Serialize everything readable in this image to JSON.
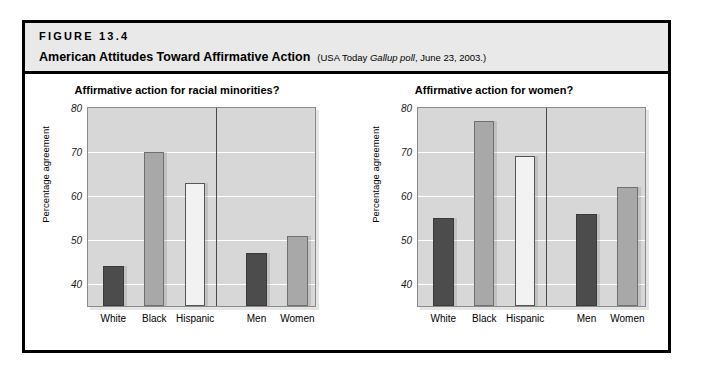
{
  "figure": {
    "number": "FIGURE 13.4",
    "title": "American Attitudes Toward Affirmative Action",
    "source_prefix": "(USA Today ",
    "source_italic": "Gallup poll",
    "source_suffix": ", June 23, 2003.)"
  },
  "chart_data": [
    {
      "type": "bar",
      "title": "Affirmative action for racial minorities?",
      "xlabel": "",
      "ylabel": "Percentage agreement",
      "ylim": [
        35,
        80
      ],
      "yticks": [
        40,
        50,
        60,
        70,
        80
      ],
      "grid": true,
      "legend": "none",
      "categories": [
        "White",
        "Black",
        "Hispanic",
        "Men",
        "Women"
      ],
      "values": [
        44,
        70,
        63,
        47,
        51
      ],
      "group_break_after": "Hispanic",
      "bar_styles": [
        "dark",
        "mid",
        "light",
        "dark",
        "mid"
      ]
    },
    {
      "type": "bar",
      "title": "Affirmative action for women?",
      "xlabel": "",
      "ylabel": "Percentage agreement",
      "ylim": [
        35,
        80
      ],
      "yticks": [
        40,
        50,
        60,
        70,
        80
      ],
      "grid": true,
      "legend": "none",
      "categories": [
        "White",
        "Black",
        "Hispanic",
        "Men",
        "Women"
      ],
      "values": [
        55,
        77,
        69,
        56,
        62
      ],
      "group_break_after": "Hispanic",
      "bar_styles": [
        "dark",
        "mid",
        "light",
        "dark",
        "mid"
      ]
    }
  ],
  "colors": {
    "plot_background": "#d7d7d7",
    "gridline": "#ffffff",
    "bar_dark": "#4c4c4c",
    "bar_mid": "#a8a8a8",
    "bar_light": "#f2f2f2",
    "frame": "#000000",
    "header_background": "#e9e9e9"
  }
}
